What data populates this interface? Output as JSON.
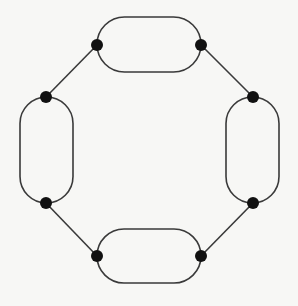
{
  "diagram": {
    "type": "cycle-graph-with-loops",
    "colors": {
      "background": "#f7f7f5",
      "stroke": "#3a3a3a",
      "node_fill": "#111111"
    },
    "nodes": [
      {
        "id": "n1",
        "x": 97,
        "y": 45
      },
      {
        "id": "n2",
        "x": 201,
        "y": 45
      },
      {
        "id": "n3",
        "x": 253,
        "y": 97
      },
      {
        "id": "n4",
        "x": 253,
        "y": 203
      },
      {
        "id": "n5",
        "x": 201,
        "y": 256
      },
      {
        "id": "n6",
        "x": 97,
        "y": 256
      },
      {
        "id": "n7",
        "x": 46,
        "y": 203
      },
      {
        "id": "n8",
        "x": 46,
        "y": 97
      }
    ],
    "stadiums": [
      {
        "id": "top",
        "x": 97,
        "y": 17,
        "w": 104,
        "h": 55,
        "orientation": "horizontal"
      },
      {
        "id": "right",
        "x": 226,
        "y": 97,
        "w": 53,
        "h": 106,
        "orientation": "vertical"
      },
      {
        "id": "bottom",
        "x": 97,
        "y": 229,
        "w": 104,
        "h": 54,
        "orientation": "horizontal"
      },
      {
        "id": "left",
        "x": 20,
        "y": 97,
        "w": 53,
        "h": 106,
        "orientation": "vertical"
      }
    ],
    "edges": [
      {
        "from": "n2",
        "to": "n3"
      },
      {
        "from": "n4",
        "to": "n5"
      },
      {
        "from": "n6",
        "to": "n7"
      },
      {
        "from": "n8",
        "to": "n1"
      }
    ],
    "node_radius": 6
  }
}
